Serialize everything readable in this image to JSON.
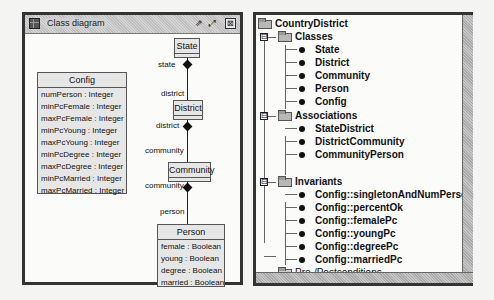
{
  "diagram_window": {
    "title": "Class diagram",
    "buttons": {
      "detach": "⇗",
      "maximize": "⤢",
      "close": "⊠"
    },
    "classes": {
      "state": {
        "name": "State"
      },
      "district": {
        "name": "District"
      },
      "community": {
        "name": "Community"
      },
      "config": {
        "name": "Config",
        "attributes": [
          "numPerson : Integer",
          "minPcFemale : Integer",
          "maxPcFemale : Integer",
          "minPcYoung : Integer",
          "maxPcYoung : Integer",
          "minPcDegree : Integer",
          "maxPcDegree : Integer",
          "minPcMarried : Integer",
          "maxPcMarried : Integer"
        ]
      },
      "person": {
        "name": "Person",
        "attributes": [
          "female : Boolean",
          "young : Boolean",
          "degree : Boolean",
          "married : Boolean"
        ]
      }
    },
    "roles": {
      "state": "state",
      "district_top": "district",
      "district_bottom": "district",
      "community_top": "community",
      "community_bottom": "community",
      "person": "person"
    }
  },
  "tree": {
    "root": "CountryDistrict",
    "groups": [
      {
        "label": "Classes",
        "items": [
          "State",
          "District",
          "Community",
          "Person",
          "Config"
        ]
      },
      {
        "label": "Associations",
        "items": [
          "StateDistrict",
          "DistrictCommunity",
          "CommunityPerson"
        ]
      },
      {
        "label": "Invariants",
        "items": [
          "Config::singletonAndNumPerson",
          "Config::percentOk",
          "Config::femalePc",
          "Config::youngPc",
          "Config::degreePc",
          "Config::marriedPc"
        ]
      },
      {
        "label": "Pre-/Postconditions",
        "items": []
      }
    ],
    "expander_symbol": "⊟"
  }
}
